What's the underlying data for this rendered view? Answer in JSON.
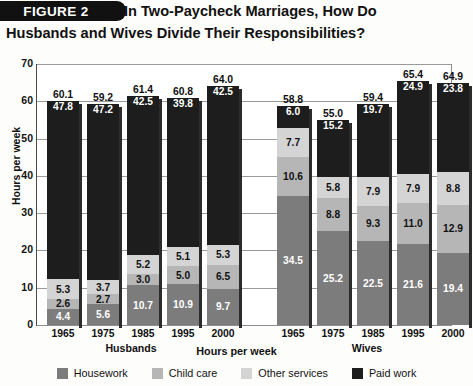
{
  "figure": {
    "tag": "FIGURE 2",
    "title_line1": "In Two-Paycheck Marriages, How Do",
    "title_line2": "Husbands and Wives Divide Their Responsibilities?"
  },
  "axes": {
    "ylabel": "Hours per week",
    "xlabel": "Hours per week",
    "yticks": [
      "70",
      "60",
      "50",
      "40",
      "30",
      "20",
      "10",
      "0"
    ],
    "group_husbands": "Husbands",
    "group_wives": "Wives"
  },
  "legend": {
    "items": [
      {
        "label": "Housework",
        "color": "#7c7c7c",
        "swatch_name": "legend-swatch-housework"
      },
      {
        "label": "Child care",
        "color": "#b6b6b6",
        "swatch_name": "legend-swatch-child-care"
      },
      {
        "label": "Other services",
        "color": "#d4d4d4",
        "swatch_name": "legend-swatch-other-services"
      },
      {
        "label": "Paid work",
        "color": "#1d1d1d",
        "swatch_name": "legend-swatch-paid-work"
      }
    ]
  },
  "chart_data": {
    "type": "bar",
    "subtype": "stacked",
    "title": "In Two-Paycheck Marriages, How Do Husbands and Wives Divide Their Responsibilities?",
    "xlabel": "Hours per week",
    "ylabel": "Hours per week",
    "ylim": [
      0,
      70
    ],
    "ytick_step": 10,
    "grid": true,
    "legend_position": "bottom",
    "groups": [
      "Husbands",
      "Wives"
    ],
    "categories": [
      "1965",
      "1975",
      "1985",
      "1995",
      "2000"
    ],
    "series": [
      {
        "name": "Housework",
        "color": "#7c7c7c",
        "husbands": [
          4.4,
          5.6,
          10.7,
          10.9,
          9.7
        ],
        "wives": [
          34.5,
          25.2,
          22.5,
          21.6,
          19.4
        ]
      },
      {
        "name": "Child care",
        "color": "#b6b6b6",
        "husbands": [
          2.6,
          2.7,
          3.0,
          5.0,
          6.5
        ],
        "wives": [
          10.6,
          8.8,
          9.3,
          11.0,
          12.9
        ]
      },
      {
        "name": "Other services",
        "color": "#d4d4d4",
        "husbands": [
          5.3,
          3.7,
          5.2,
          5.1,
          5.3
        ],
        "wives": [
          7.7,
          5.8,
          7.9,
          7.9,
          8.8
        ]
      },
      {
        "name": "Paid work",
        "color": "#1d1d1d",
        "husbands": [
          47.8,
          47.2,
          42.5,
          39.8,
          42.5
        ],
        "wives": [
          6.0,
          15.2,
          19.7,
          24.9,
          23.8
        ]
      }
    ],
    "totals": {
      "husbands": [
        60.1,
        59.2,
        61.4,
        60.8,
        64.0
      ],
      "wives": [
        58.8,
        55.0,
        59.4,
        65.4,
        64.9
      ]
    }
  }
}
